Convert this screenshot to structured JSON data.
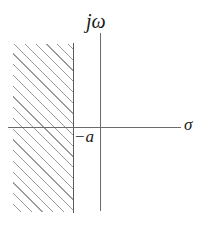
{
  "figure": {
    "background_color": "#ffffff",
    "width": 207,
    "height": 231
  },
  "axes": {
    "vertical": {
      "name": "imaginary-axis",
      "label": "jω",
      "color": "#6b6b6b"
    },
    "horizontal": {
      "name": "real-axis",
      "label": "σ",
      "color": "#6b6b6b"
    }
  },
  "markers": {
    "pole_boundary": {
      "label": "−a",
      "description": "vertical boundary of shaded region at sigma equals minus a",
      "color": "#5a5a5a"
    }
  },
  "shaded_region": {
    "name": "region-of-convergence",
    "pattern": "diagonal-hatching",
    "hatch_angle_deg": 45,
    "hatch_color": "#9a9a9a",
    "side": "left of sigma = -a"
  },
  "chart_data": {
    "type": "scatter",
    "title": "",
    "xlabel": "σ",
    "ylabel": "jω",
    "xlim": [
      -2.2,
      2.2
    ],
    "ylim": [
      -1.6,
      1.6
    ],
    "grid": false,
    "legend": null,
    "annotations": [
      {
        "text": "jω",
        "role": "vertical-axis-label"
      },
      {
        "text": "σ",
        "role": "horizontal-axis-label"
      },
      {
        "text": "−a",
        "role": "boundary-tick-label"
      }
    ],
    "regions": [
      {
        "label": "hatched half-plane",
        "x_range": [
          -2.2,
          -0.6
        ],
        "y_range": [
          -1.25,
          1.25
        ],
        "fill": "hatch-45"
      }
    ],
    "vlines": [
      {
        "x": -0.6,
        "label": "−a"
      }
    ]
  }
}
